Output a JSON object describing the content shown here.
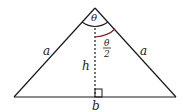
{
  "diagram": {
    "labels": {
      "left_side": "a",
      "right_side": "a",
      "height": "h",
      "base": "b",
      "apex_angle": "θ",
      "half_angle_num": "θ",
      "half_angle_den": "2"
    },
    "colors": {
      "lines": "#1a1a1a",
      "half_angle_arc": "#7a2020"
    }
  }
}
